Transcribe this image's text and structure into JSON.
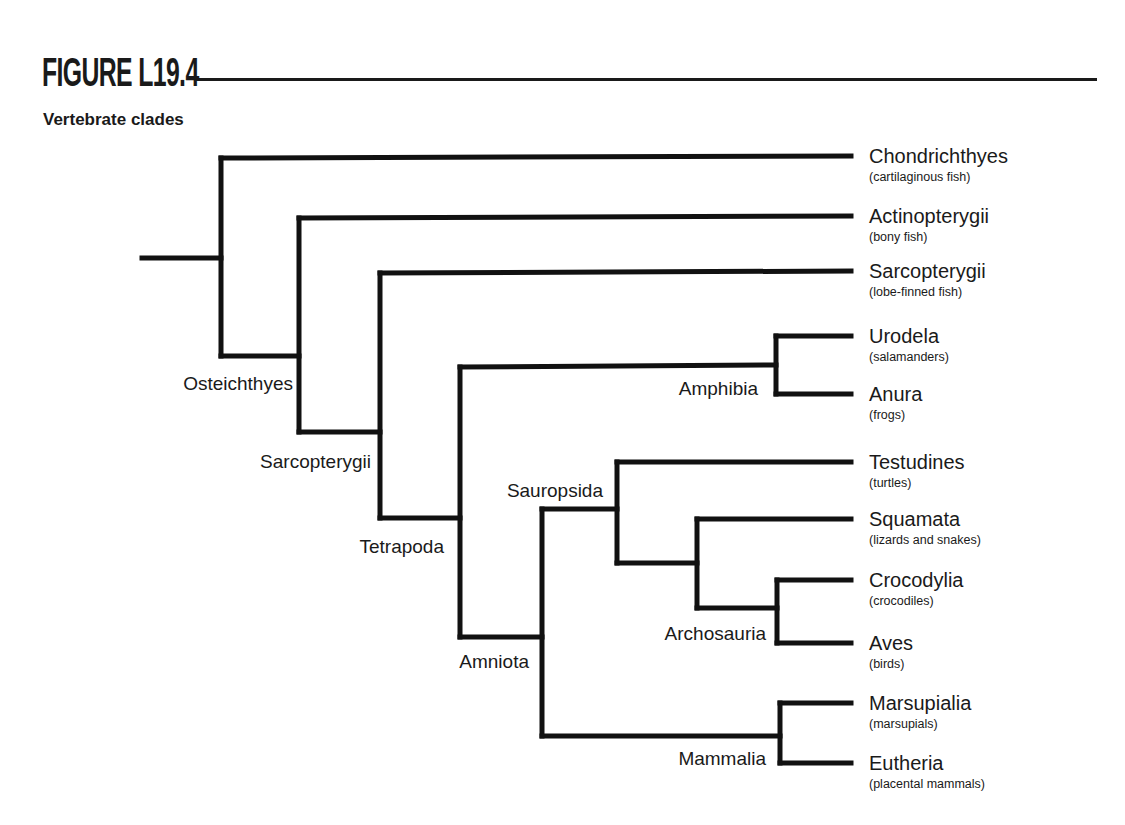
{
  "figure": {
    "title": "FIGURE L19.4",
    "subtitle": "Vertebrate clades"
  },
  "leaves": [
    {
      "name": "Chondrichthyes",
      "common": "(cartilaginous fish)",
      "y": 156
    },
    {
      "name": "Actinopterygii",
      "common": "(bony fish)",
      "y": 216
    },
    {
      "name": "Sarcopterygii",
      "common": "(lobe-finned fish)",
      "y": 271
    },
    {
      "name": "Urodela",
      "common": "(salamanders)",
      "y": 336
    },
    {
      "name": "Anura",
      "common": "(frogs)",
      "y": 394
    },
    {
      "name": "Testudines",
      "common": "(turtles)",
      "y": 462
    },
    {
      "name": "Squamata",
      "common": "(lizards and snakes)",
      "y": 519
    },
    {
      "name": "Crocodylia",
      "common": "(crocodiles)",
      "y": 580
    },
    {
      "name": "Aves",
      "common": "(birds)",
      "y": 643
    },
    {
      "name": "Marsupialia",
      "common": "(marsupials)",
      "y": 703
    },
    {
      "name": "Eutheria",
      "common": "(placental mammals)",
      "y": 763
    }
  ],
  "clade_labels": [
    {
      "name": "Osteichthyes",
      "x": 293,
      "y": 390
    },
    {
      "name": "Sarcopterygii",
      "x": 371,
      "y": 468
    },
    {
      "name": "Tetrapoda",
      "x": 444,
      "y": 553
    },
    {
      "name": "Amphibia",
      "x": 758,
      "y": 395
    },
    {
      "name": "Sauropsida",
      "x": 603,
      "y": 497
    },
    {
      "name": "Amniota",
      "x": 529,
      "y": 668
    },
    {
      "name": "Archosauria",
      "x": 766,
      "y": 640
    },
    {
      "name": "Mammalia",
      "x": 766,
      "y": 765
    }
  ],
  "branches": [
    "M142,258 L221,258",
    "M221,158 L851,156",
    "M221,158 L221,356",
    "M221,356 L299,356",
    "M299,218 L851,216",
    "M299,218 L299,432",
    "M299,432 L380,432",
    "M380,273 L851,271",
    "M380,273 L380,518",
    "M380,518 L460,518",
    "M460,367 L776,365",
    "M460,367 L460,637",
    "M460,637 L542,637",
    "M776,336 L776,394",
    "M776,336 L851,336",
    "M776,394 L851,394",
    "M542,509 L617,509",
    "M542,509 L542,736",
    "M542,736 L780,736",
    "M617,462 L851,462",
    "M617,462 L617,563",
    "M617,563 L697,563",
    "M697,519 L851,519",
    "M697,519 L697,608",
    "M697,608 L777,608",
    "M777,580 L851,580",
    "M777,580 L777,643",
    "M777,643 L851,643",
    "M780,703 L851,703",
    "M780,703 L780,763",
    "M780,763 L851,763"
  ],
  "layout": {
    "label_x": 869,
    "ink_color": "#111111"
  }
}
